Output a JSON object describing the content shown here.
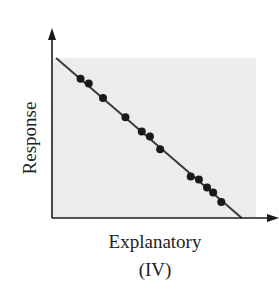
{
  "chart_data": {
    "type": "scatter",
    "title": "(IV)",
    "xlabel": "Explanatory",
    "ylabel": "Response",
    "grid": false,
    "legend": null,
    "trend": "strong negative linear association",
    "fit_line": {
      "x": [
        0.02,
        0.93
      ],
      "y": [
        1.0,
        0.0
      ]
    },
    "points": [
      {
        "x": 0.14,
        "y": 0.87
      },
      {
        "x": 0.18,
        "y": 0.84
      },
      {
        "x": 0.25,
        "y": 0.75
      },
      {
        "x": 0.36,
        "y": 0.63
      },
      {
        "x": 0.44,
        "y": 0.54
      },
      {
        "x": 0.48,
        "y": 0.51
      },
      {
        "x": 0.53,
        "y": 0.43
      },
      {
        "x": 0.68,
        "y": 0.26
      },
      {
        "x": 0.72,
        "y": 0.24
      },
      {
        "x": 0.76,
        "y": 0.19
      },
      {
        "x": 0.79,
        "y": 0.16
      },
      {
        "x": 0.83,
        "y": 0.1
      }
    ],
    "xlim": [
      0,
      1
    ],
    "ylim": [
      0,
      1
    ]
  },
  "labels": {
    "x_axis": "Explanatory",
    "y_axis": "Response",
    "panel": "(IV)"
  },
  "colors": {
    "plot_bg": "#ececec",
    "ink": "#1a1a1a",
    "line": "#3a3a3a"
  }
}
